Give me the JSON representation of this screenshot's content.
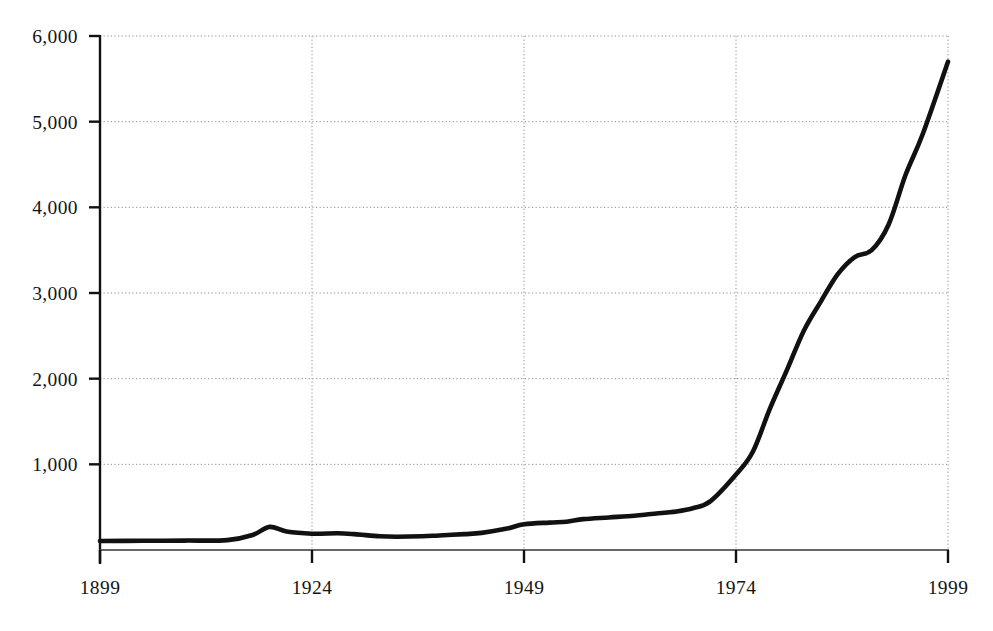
{
  "chart_data": {
    "type": "line",
    "title": "",
    "subtitle": "",
    "xlabel": "",
    "ylabel": "",
    "xlim": [
      1899,
      1999
    ],
    "ylim": [
      0,
      6000
    ],
    "grid": true,
    "legend": null,
    "y_ticks": [
      {
        "value": 6000,
        "label": "6,000"
      },
      {
        "value": 5000,
        "label": "5,000"
      },
      {
        "value": 4000,
        "label": "4,000"
      },
      {
        "value": 3000,
        "label": "3,000"
      },
      {
        "value": 2000,
        "label": "2,000"
      },
      {
        "value": 1000,
        "label": "1,000"
      }
    ],
    "x_ticks": [
      {
        "value": 1899,
        "label": "1899"
      },
      {
        "value": 1924,
        "label": "1924"
      },
      {
        "value": 1949,
        "label": "1949"
      },
      {
        "value": 1974,
        "label": "1974"
      },
      {
        "value": 1999,
        "label": "1999"
      }
    ],
    "series": [
      {
        "name": "series-1",
        "color": "#111111",
        "x": [
          1899,
          1904,
          1909,
          1914,
          1917,
          1919,
          1921,
          1924,
          1927,
          1929,
          1932,
          1934,
          1937,
          1939,
          1942,
          1944,
          1947,
          1949,
          1952,
          1954,
          1956,
          1959,
          1962,
          1964,
          1967,
          1969,
          1971,
          1974,
          1976,
          1978,
          1980,
          1982,
          1984,
          1986,
          1988,
          1990,
          1992,
          1994,
          1996,
          1999
        ],
        "y": [
          105,
          108,
          110,
          115,
          175,
          270,
          215,
          190,
          195,
          185,
          160,
          155,
          160,
          170,
          185,
          200,
          250,
          300,
          320,
          330,
          360,
          380,
          400,
          420,
          450,
          490,
          570,
          880,
          1150,
          1650,
          2100,
          2560,
          2900,
          3220,
          3420,
          3500,
          3800,
          4380,
          4850,
          5700
        ]
      }
    ],
    "annotations": [],
    "caption": ""
  },
  "axes": {
    "y_axis_name": "value-axis",
    "x_axis_name": "year-axis"
  }
}
